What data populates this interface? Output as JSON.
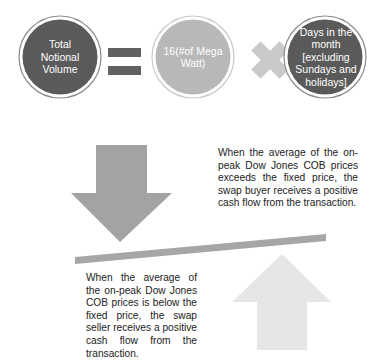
{
  "equation": {
    "term_1": {
      "label": "Total Notional Volume",
      "fill": "#5a5a5a"
    },
    "operator_1": {
      "symbol": "=",
      "color": "#606060"
    },
    "term_2": {
      "label": "16(#of Mega Watt)",
      "fill": "#b8b8b8"
    },
    "operator_2": {
      "symbol": "×",
      "color": "#c9c9c9"
    },
    "term_3": {
      "label": "Days in the month [excluding Sundays and holidays]",
      "fill": "#5a5a5a"
    }
  },
  "seesaw": {
    "down_arrow": {
      "direction": "down",
      "color": "#a3a3a3"
    },
    "beam": {
      "color": "#a6a6a6"
    },
    "up_arrow": {
      "direction": "up",
      "color": "#e6e6e6"
    }
  },
  "buyer_note": {
    "text": "When the average of the on-peak Dow Jones COB prices exceeds the fixed price, the swap buyer receives a positive cash flow from the transaction."
  },
  "seller_note": {
    "text": "When the average of the on-peak Dow Jones COB prices is below the fixed price, the swap seller receives a positive cash flow from the transaction."
  }
}
